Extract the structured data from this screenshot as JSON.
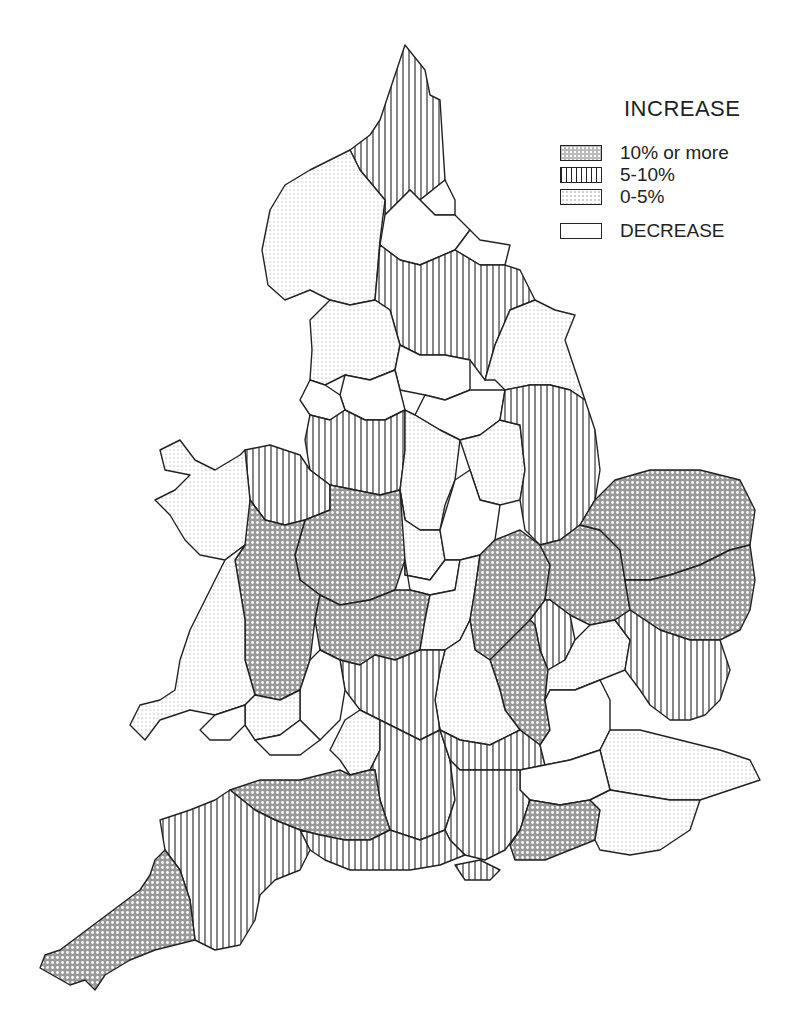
{
  "legend": {
    "title": "INCREASE",
    "items": [
      {
        "key": "high",
        "label": "10% or more"
      },
      {
        "key": "mid",
        "label": "5-10%"
      },
      {
        "key": "low",
        "label": "0-5%"
      },
      {
        "key": "dec",
        "label": "DECREASE"
      }
    ]
  },
  "map": {
    "subject": "England and Wales by county",
    "regions": [
      {
        "name": "northumberland",
        "category": "mid",
        "points": "380,120 405,45 425,70 430,95 440,100 445,180 420,200 410,190 385,215 385,200 360,170 350,150 370,135"
      },
      {
        "name": "cumbria",
        "category": "low",
        "points": "350,150 360,170 385,200 380,240 375,300 350,305 330,300 310,290 285,300 268,285 262,250 270,210 285,185 310,170 330,160"
      },
      {
        "name": "tyne-and-wear",
        "category": "dec",
        "points": "420,200 445,180 455,200 455,215 435,215"
      },
      {
        "name": "durham",
        "category": "dec",
        "points": "385,215 410,190 420,200 435,215 455,215 470,230 455,250 420,265 400,260 380,245"
      },
      {
        "name": "cleveland",
        "category": "dec",
        "points": "455,250 470,230 480,240 510,245 505,265 480,265"
      },
      {
        "name": "north-yorkshire",
        "category": "mid",
        "points": "380,245 400,260 420,265 455,250 480,265 505,265 520,270 535,300 510,310 495,345 485,380 470,360 445,355 420,355 400,345 390,310 375,300"
      },
      {
        "name": "humberside",
        "category": "low",
        "points": "510,310 535,300 555,310 575,315 565,340 575,370 585,400 570,390 550,385 530,385 505,390 495,380 485,380 495,345"
      },
      {
        "name": "lancashire",
        "category": "low",
        "points": "330,300 350,305 375,300 390,310 400,345 395,370 370,380 345,375 325,385 310,380 312,350 310,320"
      },
      {
        "name": "west-yorkshire",
        "category": "dec",
        "points": "400,345 420,355 445,355 470,360 470,390 445,400 425,395 400,390 395,370"
      },
      {
        "name": "greater-manchester",
        "category": "dec",
        "points": "345,375 370,380 395,370 400,390 405,410 385,420 365,420 345,410 340,395"
      },
      {
        "name": "south-yorkshire",
        "category": "dec",
        "points": "425,395 445,400 470,390 505,390 500,420 480,435 460,440 440,430 415,415"
      },
      {
        "name": "merseyside",
        "category": "dec",
        "points": "310,380 325,385 340,395 345,410 330,420 310,415 300,400"
      },
      {
        "name": "cheshire",
        "category": "mid",
        "points": "310,415 330,420 345,410 365,420 385,420 405,410 405,450 400,490 380,495 355,490 330,485 310,470 305,440"
      },
      {
        "name": "derbyshire",
        "category": "low",
        "points": "405,410 415,415 440,430 460,440 455,480 445,505 440,530 420,530 405,520 400,490 405,450"
      },
      {
        "name": "nottinghamshire",
        "category": "low",
        "points": "460,440 480,435 500,420 520,425 525,470 520,500 500,505 480,500 470,470"
      },
      {
        "name": "lincolnshire",
        "category": "mid",
        "points": "505,390 530,385 550,385 570,390 585,400 595,430 600,470 595,500 580,525 560,540 540,545 525,530 520,500 525,470 520,425 500,420"
      },
      {
        "name": "clwyd",
        "category": "mid",
        "points": "245,450 270,445 300,455 310,470 330,485 330,510 305,520 285,525 265,520 250,500"
      },
      {
        "name": "gwynedd",
        "category": "low",
        "points": "160,450 180,440 195,460 215,470 240,455 245,450 250,500 265,520 245,545 225,560 200,555 185,540 170,515 155,500 175,490 190,475 165,470"
      },
      {
        "name": "shropshire",
        "category": "high",
        "points": "305,520 330,510 330,485 355,490 380,495 400,490 405,520 405,560 395,590 370,600 340,605 320,595 300,580 295,555"
      },
      {
        "name": "staffordshire",
        "category": "low",
        "points": "400,490 405,520 420,530 440,530 445,560 430,580 405,575 405,560"
      },
      {
        "name": "powys",
        "category": "high",
        "points": "250,500 265,520 285,525 305,520 295,555 300,580 320,595 315,620 310,660 300,690 280,700 255,695 245,660 245,620 240,590 235,560 245,545"
      },
      {
        "name": "dyfed",
        "category": "low",
        "points": "225,560 245,545 235,560 240,590 245,620 245,660 255,695 245,705 215,715 190,710 160,720 145,740 130,725 140,705 160,700 175,690 180,660 190,630 205,600 215,580"
      },
      {
        "name": "leicestershire",
        "category": "dec",
        "points": "440,530 455,480 470,470 480,500 500,505 495,540 480,555 460,560 445,560"
      },
      {
        "name": "west-midlands",
        "category": "dec",
        "points": "405,560 405,575 430,580 445,560 460,560 455,590 430,595 410,590"
      },
      {
        "name": "hereford-worcester",
        "category": "high",
        "points": "320,595 340,605 370,600 395,590 410,590 430,595 425,620 420,650 395,660 375,655 360,665 340,660 320,650 315,620"
      },
      {
        "name": "warwickshire",
        "category": "low",
        "points": "430,595 455,590 460,560 480,555 475,590 470,620 460,640 445,650 425,650 420,650 425,620"
      },
      {
        "name": "northamptonshire",
        "category": "high",
        "points": "480,555 495,540 520,530 540,545 550,565 545,600 530,620 510,640 490,660 475,650 470,620 475,590"
      },
      {
        "name": "cambridgeshire",
        "category": "high",
        "points": "540,545 560,540 580,525 600,530 620,550 625,580 630,610 615,620 590,625 570,615 550,600 545,600 550,565"
      },
      {
        "name": "norfolk",
        "category": "high",
        "points": "580,525 595,500 615,480 650,470 700,470 740,480 755,510 750,545 730,550 700,565 670,575 650,580 625,580 620,550 600,530"
      },
      {
        "name": "suffolk",
        "category": "high",
        "points": "625,580 650,580 670,575 700,565 730,550 750,545 755,580 750,610 740,630 720,640 690,640 660,630 630,610"
      },
      {
        "name": "bedfordshire",
        "category": "mid",
        "points": "545,600 550,600 570,615 575,640 565,660 548,670 540,650 535,625 530,620"
      },
      {
        "name": "buckinghamshire",
        "category": "high",
        "points": "490,660 510,640 530,620 535,625 540,650 548,670 545,700 550,730 540,745 520,730 505,710 500,690"
      },
      {
        "name": "hertfordshire",
        "category": "low",
        "points": "548,670 565,660 575,640 590,625 615,620 630,640 625,670 600,680 575,690 550,690 545,700"
      },
      {
        "name": "essex",
        "category": "mid",
        "points": "615,620 630,610 660,630 690,640 720,640 730,670 720,700 705,715 690,720 670,720 650,705 640,690 625,670 630,640"
      },
      {
        "name": "oxfordshire",
        "category": "low",
        "points": "460,640 470,620 475,650 490,660 500,690 505,710 520,730 490,745 460,740 440,730 435,700 440,670 445,650"
      },
      {
        "name": "gloucestershire",
        "category": "mid",
        "points": "375,655 395,660 420,650 425,650 445,650 440,670 435,700 440,730 420,740 400,730 380,720 360,710 345,690 340,660 360,665"
      },
      {
        "name": "gwent",
        "category": "dec",
        "points": "300,690 310,660 320,650 340,660 345,690 340,720 320,740 300,720"
      },
      {
        "name": "mid-glamorgan",
        "category": "low",
        "points": "245,705 255,695 280,700 300,690 300,720 280,735 255,740 245,725"
      },
      {
        "name": "west-glamorgan",
        "category": "dec",
        "points": "215,715 245,705 245,725 230,740 210,740 200,730"
      },
      {
        "name": "south-glamorgan",
        "category": "dec",
        "points": "255,740 280,735 300,720 320,740 300,755 270,755"
      },
      {
        "name": "avon",
        "category": "low",
        "points": "345,720 360,710 380,720 380,750 370,770 350,775 340,760 330,750"
      },
      {
        "name": "wiltshire",
        "category": "mid",
        "points": "380,720 400,730 420,740 440,730 450,760 455,800 445,830 420,840 390,830 380,800 375,770 370,770 380,750"
      },
      {
        "name": "berkshire",
        "category": "mid",
        "points": "440,730 460,740 490,745 520,730 540,745 545,765 520,770 490,770 460,770 450,760"
      },
      {
        "name": "greater-london",
        "category": "dec",
        "points": "545,700 550,690 575,690 600,680 610,700 610,730 600,750 570,760 545,765 540,745 550,730"
      },
      {
        "name": "kent",
        "category": "low",
        "points": "600,750 610,730 640,730 680,740 720,750 750,760 760,780 730,790 700,800 670,800 640,795 610,790 605,770"
      },
      {
        "name": "surrey",
        "category": "dec",
        "points": "520,770 545,765 570,760 600,750 605,770 610,790 590,800 560,805 530,800 520,790"
      },
      {
        "name": "hampshire",
        "category": "mid",
        "points": "450,760 460,770 490,770 520,770 520,790 530,800 520,830 505,850 485,860 465,855 450,840 445,830 455,800"
      },
      {
        "name": "isle-of-wight",
        "category": "mid",
        "points": "455,865 480,860 500,870 490,880 465,880"
      },
      {
        "name": "west-sussex",
        "category": "high",
        "points": "530,800 560,805 590,800 600,810 595,840 570,850 545,860 515,860 510,845 520,830"
      },
      {
        "name": "east-sussex",
        "category": "low",
        "points": "590,800 610,790 640,795 670,800 700,800 690,830 660,850 630,855 600,850 595,840 600,810"
      },
      {
        "name": "somerset",
        "category": "high",
        "points": "230,790 260,780 300,780 340,770 350,775 370,770 375,770 380,800 390,830 370,840 345,840 320,835 300,830 275,820 255,810"
      },
      {
        "name": "dorset",
        "category": "mid",
        "points": "300,830 320,835 345,840 370,840 390,830 420,840 445,830 450,840 465,855 440,865 410,870 380,870 350,870 325,860 310,850"
      },
      {
        "name": "devon",
        "category": "mid",
        "points": "160,820 190,810 215,800 230,790 255,810 275,820 300,830 310,850 300,870 275,880 260,895 255,920 240,945 215,950 195,940 190,900 180,870 165,850"
      },
      {
        "name": "cornwall",
        "category": "high",
        "points": "165,850 180,870 190,900 195,940 175,945 155,950 130,960 105,975 95,990 85,980 70,985 40,968 45,955 60,950 80,935 100,920 120,905 140,890 150,875 155,860"
      }
    ]
  }
}
